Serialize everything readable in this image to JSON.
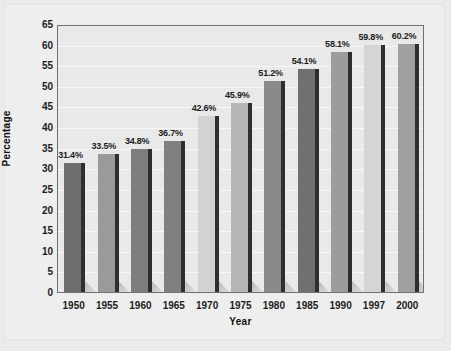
{
  "chart_data": {
    "type": "bar",
    "title": "",
    "xlabel": "Year",
    "ylabel": "Percentage",
    "categories": [
      "1950",
      "1955",
      "1960",
      "1965",
      "1970",
      "1975",
      "1980",
      "1985",
      "1990",
      "1997",
      "2000"
    ],
    "values": [
      31.4,
      33.5,
      34.8,
      36.7,
      42.6,
      45.9,
      51.2,
      54.1,
      58.1,
      59.8,
      60.2
    ],
    "data_labels": [
      "31.4%",
      "33.5%",
      "34.8%",
      "36.7%",
      "42.6%",
      "45.9%",
      "51.2%",
      "54.1%",
      "58.1%",
      "59.8%",
      "60.2%"
    ],
    "bar_colors": [
      "#6e6e6e",
      "#9a9a9a",
      "#7e7e7e",
      "#808080",
      "#d2d2d2",
      "#b5b5b5",
      "#8a8a8a",
      "#707070",
      "#9c9c9c",
      "#d5d5d5",
      "#a0a0a0"
    ],
    "ylim": [
      0,
      65
    ],
    "ytick_step": 5,
    "ytick_labels": [
      "0",
      "5",
      "10",
      "15",
      "20",
      "25",
      "30",
      "35",
      "40",
      "45",
      "50",
      "55",
      "60",
      "65"
    ],
    "grid": true,
    "grid_axis": "y",
    "legend": false,
    "plot_background": "#e9e9e9",
    "figure_background": "#eeeeee",
    "gridline_color": "#f7f7f7",
    "axis_color": "#707070",
    "text_color": "#1c1c1c"
  }
}
